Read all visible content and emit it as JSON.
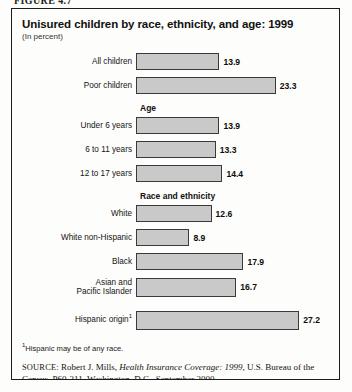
{
  "figure": {
    "number_label": "FIGURE 4.7"
  },
  "chart_header": {
    "title": "Unisured children by race, ethnicity, and age: 1999",
    "subtitle": "(In percent)"
  },
  "footnote": {
    "marker": "1",
    "text": "Hispanic may be of any race."
  },
  "source": {
    "label": "SOURCE:",
    "author": "Robert J. Mills,",
    "publication": "Health Insurance Coverage: 1999",
    "rest": ", U.S. Bureau of the Census, P60-211, Washington, D.C., September 2000"
  },
  "chart_data": {
    "type": "bar",
    "orientation": "horizontal",
    "title": "Unisured children by race, ethnicity, and age: 1999",
    "subtitle": "(In percent)",
    "xlabel": "",
    "ylabel": "",
    "xlim": [
      0,
      30
    ],
    "grid": false,
    "legend": null,
    "bar_color": "#c9c9c9",
    "bar_border_color": "#3a3a3a",
    "groups": [
      {
        "header": "",
        "items": [
          {
            "label": "All children",
            "value": 13.9,
            "value_label": "13.9"
          },
          {
            "label": "Poor children",
            "value": 23.3,
            "value_label": "23.3"
          }
        ]
      },
      {
        "header": "Age",
        "items": [
          {
            "label": "Under 6 years",
            "value": 13.9,
            "value_label": "13.9"
          },
          {
            "label": "6 to 11 years",
            "value": 13.3,
            "value_label": "13.3"
          },
          {
            "label": "12 to 17 years",
            "value": 14.4,
            "value_label": "14.4"
          }
        ]
      },
      {
        "header": "Race and ethnicity",
        "items": [
          {
            "label": "White",
            "value": 12.6,
            "value_label": "12.6"
          },
          {
            "label": "White non-Hispanic",
            "value": 8.9,
            "value_label": "8.9"
          },
          {
            "label": "Black",
            "value": 17.9,
            "value_label": "17.9"
          },
          {
            "label": "Asian and Pacific Islander",
            "value": 16.7,
            "value_label": "16.7"
          }
        ]
      },
      {
        "header": "",
        "items": [
          {
            "label": "Hispanic origin",
            "label_sup": "1",
            "value": 27.2,
            "value_label": "27.2"
          }
        ]
      }
    ]
  }
}
